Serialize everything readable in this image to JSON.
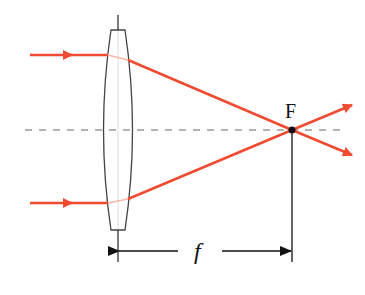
{
  "diagram": {
    "focal_point_label": "F",
    "focal_length_label": "f",
    "colors": {
      "ray": "#f04a30",
      "lens_outline": "#333333",
      "axis": "#999999",
      "dimension": "#111111"
    },
    "elements": {
      "incoming_rays": 2,
      "lens": "biconvex",
      "optical_axis": "dashed"
    }
  }
}
